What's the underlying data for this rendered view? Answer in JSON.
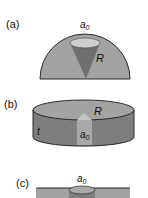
{
  "panels": [
    {
      "id": "a",
      "label": "(a)",
      "aperture": "a",
      "aperture_sub": "0",
      "radius": "R"
    },
    {
      "id": "b",
      "label": "(b)",
      "aperture": "a",
      "aperture_sub": "0",
      "radius": "R",
      "thickness": "t"
    },
    {
      "id": "c",
      "label": "(c)",
      "aperture": "a",
      "aperture_sub": "0"
    }
  ],
  "colors": {
    "body": "#a3a3a3",
    "body_dark": "#7e7e7e",
    "top": "#b9b9b9",
    "cone": "#6f6f6f",
    "hole": "#cfcfcf",
    "outline": "#2a2a2a"
  }
}
